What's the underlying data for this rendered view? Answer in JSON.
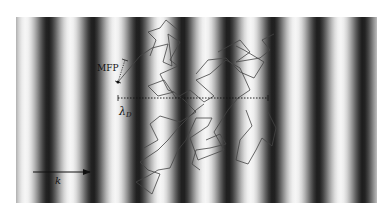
{
  "figure": {
    "pattern": {
      "x0": 16,
      "y0": 17,
      "x1": 377,
      "y1": 203,
      "period_px": 45,
      "dark_band_centers_x": [
        48,
        93,
        138,
        183,
        228,
        272,
        316,
        361
      ],
      "light_color": "#f6f6f6",
      "dark_color": "#1a1a1a"
    },
    "labels": {
      "mfp": "MFP",
      "lambda_main": "λ",
      "lambda_sub": "D",
      "k": "k"
    },
    "dotted_line": {
      "x1": 118,
      "x2": 268,
      "y": 98
    },
    "k_arrow": {
      "x1": 33,
      "x2": 90,
      "y": 172
    },
    "mfp_bar": {
      "x1": 118,
      "y1": 82,
      "x2": 125,
      "y2": 60
    },
    "walk_color": "#444444"
  }
}
